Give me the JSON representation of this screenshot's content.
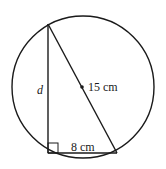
{
  "diagram": {
    "type": "geometry",
    "circle": {
      "cx": 83,
      "cy": 87,
      "r": 71
    },
    "triangle": {
      "top": [
        48,
        24
      ],
      "right_angle": [
        48,
        153
      ],
      "bottom_right": [
        117,
        153
      ]
    },
    "labels": {
      "vertical_side": "d",
      "hypotenuse": "15 cm",
      "base": "8 cm"
    },
    "colors": {
      "stroke": "#1a1a1a",
      "background": "#ffffff"
    }
  }
}
